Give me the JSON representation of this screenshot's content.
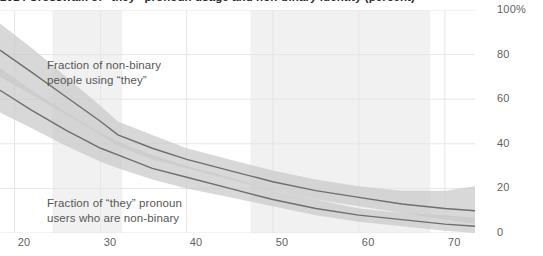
{
  "chart": {
    "title": "2014 Crosswalk of “they” pronoun usage and non-binary identity (percent)",
    "annotations": {
      "upper": "Fraction of non-binary\npeople using “they”",
      "lower": "Fraction of “they” pronoun\nusers who are non-binary"
    }
  },
  "colors": {
    "band": "#c9c9c9",
    "band_overlap": "#adadad",
    "line": "#6e6e6e",
    "gridline": "#e6e6e6",
    "shaded_band": "#f1f1f1",
    "tick_text": "#5f5f5f",
    "annotation_text": "#565656",
    "title_text": "#2b2b2b"
  },
  "chart_data": {
    "type": "line",
    "title": "2014 Crosswalk of “they” pronoun usage and non-binary identity (percent)",
    "xlabel": "",
    "ylabel": "",
    "xlim": [
      18.3,
      73.5
    ],
    "ylim": [
      0,
      100
    ],
    "grid": true,
    "legend_position": "inline-annotation",
    "xticks": [
      20,
      30,
      40,
      50,
      60,
      70
    ],
    "xtick_labels": [
      "20",
      "30",
      "40",
      "50",
      "60",
      "70"
    ],
    "yticks": [
      0,
      20,
      40,
      60,
      80,
      100
    ],
    "ytick_labels": [
      "0",
      "20",
      "40",
      "60",
      "80",
      "100%"
    ],
    "shaded_regions": [
      {
        "x0": 24.4,
        "x1": 32.5
      },
      {
        "x0": 47.4,
        "x1": 68.3
      }
    ],
    "series": [
      {
        "name": "Fraction of non-binary people using “they”",
        "x": [
          18.3,
          22,
          26,
          30,
          32,
          36,
          40,
          45,
          50,
          55,
          60,
          65,
          70,
          73.5
        ],
        "values": [
          82,
          72,
          61,
          50,
          44,
          38,
          33,
          28,
          23,
          19,
          16,
          13,
          11,
          10
        ],
        "band_lower": [
          70,
          62,
          53,
          44,
          39,
          33,
          29,
          24,
          19,
          15,
          12,
          9,
          6,
          4
        ],
        "band_upper": [
          94,
          83,
          70,
          57,
          50,
          44,
          38,
          33,
          28,
          24,
          21,
          19,
          19,
          21
        ]
      },
      {
        "name": "Fraction of “they” pronoun users who are non-binary",
        "x": [
          18.3,
          22,
          26,
          30,
          32,
          36,
          40,
          45,
          50,
          55,
          60,
          65,
          70,
          73.5
        ],
        "values": [
          64,
          55,
          46,
          38,
          35,
          29,
          25,
          20,
          15,
          11,
          8,
          6,
          4,
          3
        ],
        "band_lower": [
          54,
          47,
          39,
          32,
          29,
          24,
          20,
          16,
          12,
          8,
          5,
          3,
          1,
          0
        ],
        "band_upper": [
          74,
          64,
          54,
          45,
          41,
          35,
          30,
          25,
          19,
          15,
          11,
          9,
          8,
          7
        ]
      }
    ]
  }
}
